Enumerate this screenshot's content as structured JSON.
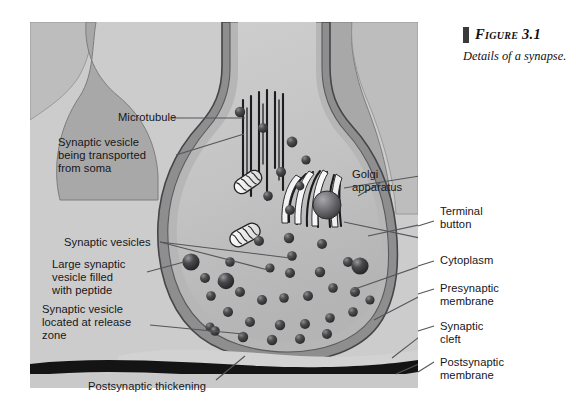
{
  "figure": {
    "number_label": "Figure 3.1",
    "caption": "Details of a synapse.",
    "bar_color": "#3a3a3c"
  },
  "palette": {
    "page_background": "#ffffff",
    "panel_background": "#cccccc",
    "background_axon": "#a8a8a8",
    "terminal_outer_membrane": "#8e8e8e",
    "terminal_inner_membrane": "#b6b6b6",
    "cytoplasm": "#c2c2c2",
    "vesicle_dark": "#3d3d3f",
    "vesicle_mid": "#5a5a5c",
    "outline": "#4a4a4c",
    "postsynaptic_thickening": "#141414",
    "leader_line": "#55555a",
    "text": "#16161a"
  },
  "labels": {
    "left": [
      {
        "id": "microtubule",
        "text": "Microtubule"
      },
      {
        "id": "vesicle-transported",
        "text": "Synaptic vesicle\nbeing transported\nfrom soma"
      },
      {
        "id": "synaptic-vesicles",
        "text": "Synaptic vesicles"
      },
      {
        "id": "large-vesicle-peptide",
        "text": "Large synaptic\nvesicle filled\nwith peptide"
      },
      {
        "id": "vesicle-release-zone",
        "text": "Synaptic vesicle\nlocated at release\nzone"
      },
      {
        "id": "postsynaptic-thickening",
        "text": "Postsynaptic thickening"
      }
    ],
    "right": [
      {
        "id": "golgi-apparatus",
        "text": "Golgi\napparatus"
      },
      {
        "id": "terminal-button",
        "text": "Terminal\nbutton"
      },
      {
        "id": "cytoplasm",
        "text": "Cytoplasm"
      },
      {
        "id": "presynaptic-membrane",
        "text": "Presynaptic\nmembrane"
      },
      {
        "id": "synaptic-cleft",
        "text": "Synaptic\ncleft"
      },
      {
        "id": "postsynaptic-membrane",
        "text": "Postsynaptic\nmembrane"
      }
    ]
  },
  "diagram": {
    "type": "scientific-illustration",
    "structures": [
      "axon branches",
      "terminal button",
      "presynaptic membrane",
      "cytoplasm",
      "microtubules",
      "mitochondria",
      "Golgi apparatus",
      "synaptic vesicles",
      "large peptide-filled vesicles",
      "synaptic cleft",
      "postsynaptic thickening",
      "postsynaptic membrane"
    ]
  }
}
